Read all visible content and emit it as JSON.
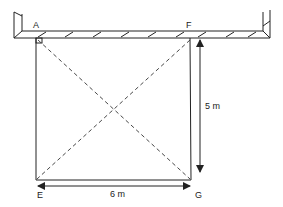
{
  "diagram": {
    "points": {
      "A": "A",
      "F": "F",
      "E": "E",
      "G": "G"
    },
    "dimensions": {
      "height": "5 m",
      "width": "6 m"
    },
    "colors": {
      "line": "#222222",
      "background": "#ffffff"
    }
  }
}
